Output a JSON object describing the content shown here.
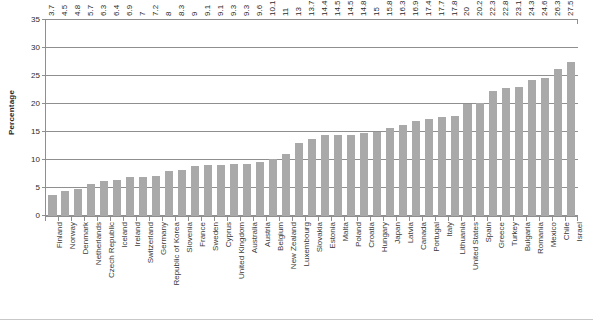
{
  "chart_data": {
    "type": "bar",
    "title": "",
    "xlabel": "",
    "ylabel": "Percentage",
    "ylim": [
      0,
      35
    ],
    "yticks": [
      0,
      5,
      10,
      15,
      20,
      25,
      30,
      35
    ],
    "grid": true,
    "legend": null,
    "orientation": "vertical",
    "bar_color": "#a9a9a9",
    "value_labels": true,
    "categories": [
      "Finland",
      "Norway",
      "Denmark",
      "Netherlands",
      "Czech Republic",
      "Iceland",
      "Ireland",
      "Switzerland",
      "Germany",
      "Republic of Korea",
      "Slovenia",
      "France",
      "Sweden",
      "Cyprus",
      "United Kingdom",
      "Australia",
      "Austria",
      "Belgium",
      "New Zealand",
      "Luxembourg",
      "Slovakia",
      "Estonia",
      "Malta",
      "Poland",
      "Croatia",
      "Hungary",
      "Japan",
      "Latvia",
      "Canada",
      "Portugal",
      "Italy",
      "Lithuania",
      "United States",
      "Spain",
      "Greece",
      "Turkey",
      "Bulgaria",
      "Romania",
      "Mexico",
      "Chile",
      "Israel"
    ],
    "values": [
      3.7,
      4.5,
      4.8,
      5.7,
      6.3,
      6.4,
      6.9,
      7,
      7.2,
      8,
      8.3,
      9,
      9.1,
      9.1,
      9.3,
      9.3,
      9.6,
      10.1,
      11,
      13,
      13.7,
      14.4,
      14.5,
      14.5,
      14.8,
      15,
      15.8,
      16.3,
      16.9,
      17.4,
      17.7,
      17.8,
      20,
      20.2,
      22.3,
      22.8,
      23.1,
      24.3,
      24.6,
      26.3,
      27.5
    ],
    "value_label_text": [
      "3.7",
      "4.5",
      "4.8",
      "5.7",
      "6.3",
      "6.4",
      "6.9",
      "7",
      "7.2",
      "8",
      "8.3",
      "9",
      "9.1",
      "9.1",
      "9.3",
      "9.3",
      "9.6",
      "10.1",
      "11",
      "13",
      "13.7",
      "14.4",
      "14.5",
      "14.5",
      "14.8",
      "15",
      "15.8",
      "16.3",
      "16.9",
      "17.4",
      "17.7",
      "17.8",
      "20",
      "20.2",
      "22.3",
      "22.8",
      "23.1",
      "24.3",
      "24.6",
      "26.3",
      "27.5"
    ]
  }
}
